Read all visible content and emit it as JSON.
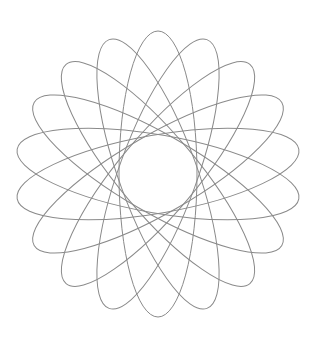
{
  "figure": {
    "type": "rosette-of-rotated-ellipses",
    "width": 319,
    "height": 344,
    "background": "#ffffff",
    "stroke_color": "#8a8a8a",
    "stroke_width": 1,
    "center": {
      "x": 158,
      "y": 174
    },
    "ellipse": {
      "rx": 143,
      "ry": 39
    },
    "count": 9,
    "rotation_step_deg": 20,
    "rotation_start_deg": 10,
    "rotations_deg": [
      10,
      30,
      50,
      70,
      90,
      110,
      130,
      150,
      170
    ]
  }
}
